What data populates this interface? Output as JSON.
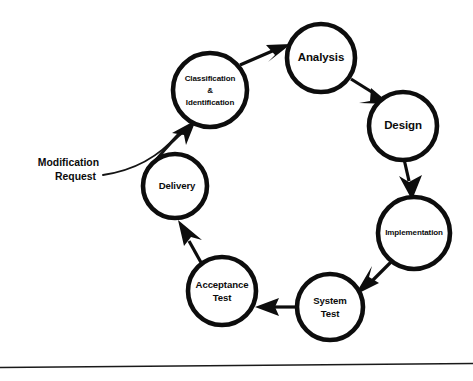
{
  "diagram": {
    "type": "cycle-flow-diagram",
    "background_color": "#ffffff",
    "stroke_color": "#0d0d0d",
    "nodes": [
      {
        "id": "classification",
        "label_lines": [
          "Classification",
          "&",
          "Identification"
        ],
        "cx": 210,
        "cy": 90,
        "r": 37,
        "text_size": "sm"
      },
      {
        "id": "analysis",
        "label_lines": [
          "Analysis"
        ],
        "cx": 321,
        "cy": 58,
        "r": 34,
        "text_size": "big"
      },
      {
        "id": "design",
        "label_lines": [
          "Design"
        ],
        "cx": 403,
        "cy": 126,
        "r": 34,
        "text_size": "big"
      },
      {
        "id": "implementation",
        "label_lines": [
          "Implementation"
        ],
        "cx": 414,
        "cy": 233,
        "r": 36,
        "text_size": "sm"
      },
      {
        "id": "system-test",
        "label_lines": [
          "System",
          "Test"
        ],
        "cx": 330,
        "cy": 307,
        "r": 33,
        "text_size": "mid"
      },
      {
        "id": "acceptance-test",
        "label_lines": [
          "Acceptance",
          "Test"
        ],
        "cx": 222,
        "cy": 291,
        "r": 34,
        "text_size": "mid"
      },
      {
        "id": "delivery",
        "label_lines": [
          "Delivery"
        ],
        "cx": 175,
        "cy": 186,
        "r": 32,
        "text_size": "mid"
      }
    ],
    "external_inputs": [
      {
        "id": "modification-request",
        "label_lines": [
          "Modification",
          "Request"
        ],
        "text_x": 99,
        "line1_y": 163,
        "line2_y": 177
      }
    ],
    "edges": [
      {
        "id": "classification-to-analysis",
        "from": "classification",
        "to": "analysis"
      },
      {
        "id": "analysis-to-design",
        "from": "analysis",
        "to": "design"
      },
      {
        "id": "design-to-implementation",
        "from": "design",
        "to": "implementation"
      },
      {
        "id": "implementation-to-system-test",
        "from": "implementation",
        "to": "system-test"
      },
      {
        "id": "system-test-to-acceptance-test",
        "from": "system-test",
        "to": "acceptance-test"
      },
      {
        "id": "acceptance-test-to-delivery",
        "from": "acceptance-test",
        "to": "delivery"
      },
      {
        "id": "delivery-to-classification",
        "from": "delivery",
        "to": "classification"
      },
      {
        "id": "modification-request-to-classification",
        "from": "modification-request",
        "to": "classification"
      }
    ],
    "footer_rule": {
      "x1": 0,
      "y1": 367,
      "x2": 473,
      "y2": 363
    }
  }
}
